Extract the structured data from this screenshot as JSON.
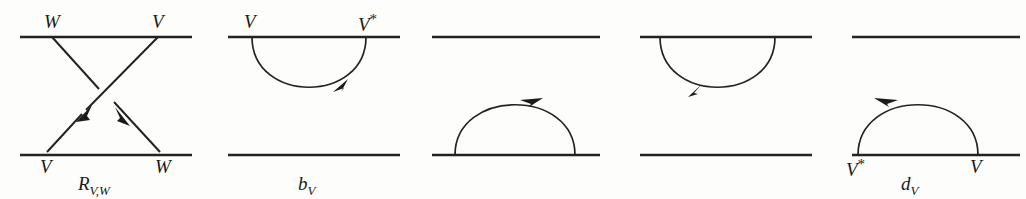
{
  "figure": {
    "stroke_color": "#232323",
    "background_color": "#fdfdfb",
    "panels": [
      {
        "id": "panel-crossing",
        "caption": "R",
        "caption_sub": "V,W",
        "caption_prime": "",
        "type": "crossing",
        "top_labels": [
          "W",
          "V"
        ],
        "bottom_labels": [
          "V",
          "W"
        ],
        "strand_labels": {
          "top_left": "W",
          "top_right": "V",
          "bottom_left": "V",
          "bottom_right": "W"
        },
        "arrows": [
          "down-left",
          "down-right"
        ],
        "has_top_line": true,
        "has_bottom_line": true
      },
      {
        "id": "panel-b",
        "caption": "b",
        "caption_sub": "V",
        "caption_prime": "",
        "type": "cap-down",
        "left_label": "V",
        "right_label": "V*",
        "left_label_star": false,
        "right_label_star": true,
        "arrow_position": "lower-right",
        "arrow_direction": "clockwise-up-right",
        "has_top_line": true,
        "has_bottom_line": true
      },
      {
        "id": "panel-d",
        "caption": "d",
        "caption_sub": "V",
        "caption_prime": "",
        "type": "cup-up",
        "left_label": "V*",
        "right_label": "V",
        "left_label_star": true,
        "right_label_star": false,
        "arrow_position": "upper-right",
        "arrow_direction": "clockwise-right",
        "has_top_line": true,
        "has_bottom_line": true
      },
      {
        "id": "panel-b-prime",
        "caption": "b",
        "caption_sub": "V",
        "caption_prime": "′",
        "type": "cap-down",
        "left_label": "V*",
        "right_label": "V",
        "left_label_star": true,
        "right_label_star": false,
        "arrow_position": "lower-left",
        "arrow_direction": "counterclockwise-down-left",
        "has_top_line": true,
        "has_bottom_line": true
      },
      {
        "id": "panel-d-prime",
        "caption": "d",
        "caption_sub": "V",
        "caption_prime": "′",
        "type": "cup-up",
        "left_label": "V",
        "right_label": "V*",
        "left_label_star": false,
        "right_label_star": true,
        "arrow_position": "upper-left",
        "arrow_direction": "counterclockwise-left",
        "has_top_line": true,
        "has_bottom_line": true
      }
    ]
  }
}
